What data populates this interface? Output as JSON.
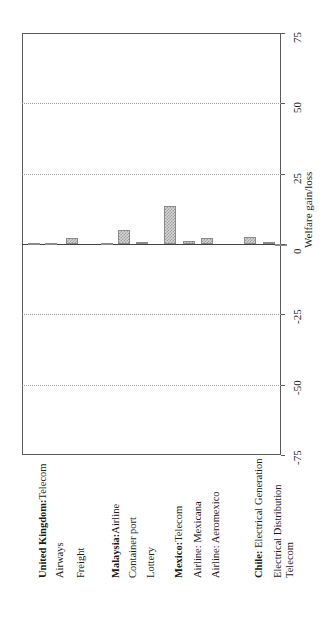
{
  "chart_data": {
    "type": "bar",
    "title": "",
    "subtitle": "",
    "xlabel": "",
    "ylabel": "Welfare gain/loss",
    "ylim": [
      -75,
      75
    ],
    "yticks": [
      75,
      50,
      25,
      0,
      -25,
      -50,
      -75
    ],
    "ytick_labels": [
      "75",
      "50",
      "25",
      "0",
      "-25",
      "-50",
      "-75"
    ],
    "grid": true,
    "grid_axis": "y",
    "legend": false,
    "orientation": "vertical-bars-rotated-page",
    "bar_fill": "#d4d4d4",
    "bar_edge": "#8a8a8a",
    "grid_color": "#9a9a9a",
    "axis_color": "#444444",
    "categories": [
      "United Kingdom:Telecom",
      "Airways",
      "Freight",
      "Malaysia:Airline",
      "Container port",
      "Lottery",
      "Mexico:Telecom",
      "Airline: Mexicana",
      "Airline: Aeromexico",
      "Chile: Electrical Generation",
      "Electrical Distribution",
      "Telecom"
    ],
    "category_bold_prefix": [
      "United Kingdom:",
      "",
      "",
      "Malaysia:",
      "",
      "",
      "Mexico:",
      "",
      "",
      "Chile:",
      "",
      ""
    ],
    "values": [
      0.2,
      0.5,
      2.0,
      0.2,
      5.0,
      0.8,
      13.5,
      1.0,
      2.0,
      2.5,
      0.8,
      0.0
    ],
    "groups": [
      {
        "name": "United Kingdom",
        "members": [
          "Telecom",
          "Airways",
          "Freight"
        ]
      },
      {
        "name": "Malaysia",
        "members": [
          "Airline",
          "Container port",
          "Lottery"
        ]
      },
      {
        "name": "Mexico",
        "members": [
          "Telecom",
          "Airline: Mexicana",
          "Airline: Aeromexico"
        ]
      },
      {
        "name": "Chile",
        "members": [
          "Electrical Generation",
          "Electrical Distribution",
          "Telecom"
        ]
      }
    ]
  },
  "axis": {
    "value_axis_title": "Welfare gain/loss"
  }
}
